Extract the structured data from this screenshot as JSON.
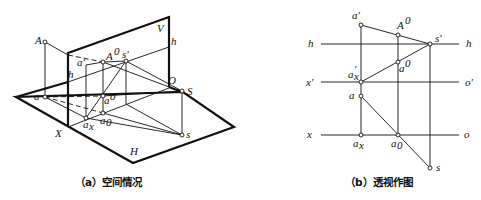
{
  "figure_a": {
    "caption": "（a）空间情况",
    "labels": {
      "A": "A",
      "a": "a",
      "h_left": "h",
      "h_right": "h",
      "a_prime": "a'",
      "A0": "A",
      "A0_sup": "0",
      "s_prime": "s'",
      "V": "V",
      "O": "O",
      "S": "S",
      "a0_upper": "a",
      "a0_upper_sup": "0",
      "a_sub0": "a",
      "a_sub0_sub": "0",
      "a_x": "a",
      "a_x_sub": "x",
      "X": "X",
      "s": "s",
      "H": "H"
    }
  },
  "figure_b": {
    "caption": "（b）透视作图",
    "labels": {
      "a_prime": "a'",
      "A0": "A",
      "A0_sup": "0",
      "h_left": "h",
      "h_right": "h",
      "s_prime": "s'",
      "a0": "a",
      "a0_sup": "0",
      "x_prime": "x'",
      "o_prime": "o'",
      "ax_prime": "a",
      "ax_prime_sub": "x",
      "ax_prime_sup": "'",
      "a": "a",
      "x": "x",
      "o": "o",
      "a_x": "a",
      "a_x_sub": "x",
      "a_0": "a",
      "a_0_sub": "0",
      "s": "s"
    }
  }
}
